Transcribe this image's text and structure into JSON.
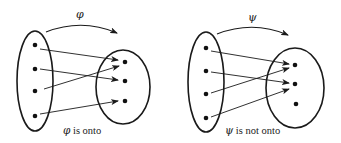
{
  "diagrams": [
    {
      "id": "phi",
      "map_symbol": "φ",
      "caption_symbol": "φ",
      "caption_text": " is onto",
      "domain_points": 4,
      "codomain_points": 3,
      "mapping": [
        [
          1,
          1
        ],
        [
          2,
          2
        ],
        [
          3,
          1
        ],
        [
          4,
          3
        ]
      ],
      "property": "onto"
    },
    {
      "id": "psi",
      "map_symbol": "ψ",
      "caption_symbol": "ψ",
      "caption_text": " is not onto",
      "domain_points": 4,
      "codomain_points": 3,
      "mapping": [
        [
          1,
          1
        ],
        [
          2,
          2
        ],
        [
          3,
          1
        ],
        [
          4,
          2
        ]
      ],
      "property": "not onto"
    }
  ],
  "colors": {
    "stroke": "#1a1a1a",
    "background": "#ffffff"
  }
}
